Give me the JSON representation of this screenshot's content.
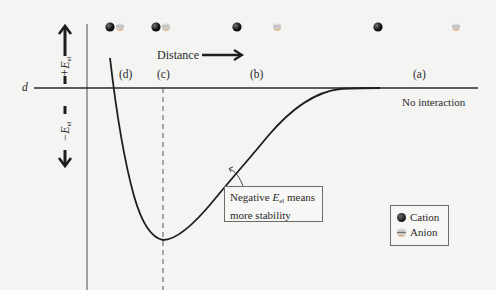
{
  "diagram": {
    "axis": {
      "baseline_label": "d",
      "positive_label": "+E",
      "positive_subscript": "el",
      "negative_label": "−E",
      "negative_subscript": "el"
    },
    "distance_label": "Distance",
    "regions": [
      {
        "id": "d",
        "label": "(d)"
      },
      {
        "id": "c",
        "label": "(c)"
      },
      {
        "id": "b",
        "label": "(b)"
      },
      {
        "id": "a",
        "label": "(a)"
      }
    ],
    "no_interaction_label": "No interaction",
    "callout": {
      "line1_prefix": "Negative ",
      "line1_symbol": "E",
      "line1_subscript": "el",
      "line1_suffix": " means",
      "line2": "more stability"
    },
    "legend": {
      "cation_label": "Cation",
      "anion_label": "Anion"
    },
    "colors": {
      "background": "#f4f4f2",
      "curve": "#1e1e1e",
      "axis": "#3a3a3a",
      "cation": "#141414",
      "anion": "#c8c8c8"
    }
  }
}
